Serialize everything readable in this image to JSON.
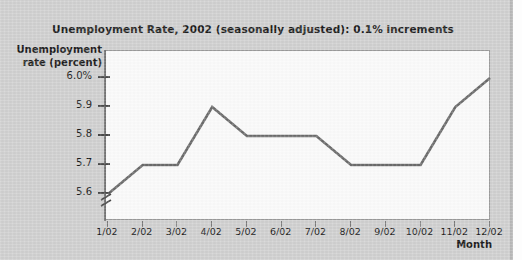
{
  "figure": {
    "background_color": "#d0d0d0",
    "plot_background_color": "#fbfbfb",
    "line_color": "#6b6b6b",
    "text_color": "#1b1b1b"
  },
  "chart_data": {
    "type": "line",
    "title": "Unemployment Rate, 2002 (seasonally adjusted): 0.1% increments",
    "xlabel": "Month",
    "ylabel_line1": "Unemployment",
    "ylabel_line2": "rate (percent)",
    "categories": [
      "1/02",
      "2/02",
      "3/02",
      "4/02",
      "5/02",
      "6/02",
      "7/02",
      "8/02",
      "9/02",
      "10/02",
      "11/02",
      "12/02"
    ],
    "values": [
      5.6,
      5.7,
      5.7,
      5.9,
      5.8,
      5.8,
      5.8,
      5.7,
      5.7,
      5.7,
      5.9,
      6.0
    ],
    "ytick_labels": [
      "6.0%",
      "5.9",
      "5.8",
      "5.7",
      "5.6"
    ],
    "ytick_values": [
      6.0,
      5.9,
      5.8,
      5.7,
      5.6
    ],
    "ylim": [
      5.6,
      6.0
    ],
    "y_axis_break": true,
    "grid": false,
    "legend": false,
    "series_name": "Unemployment rate"
  }
}
